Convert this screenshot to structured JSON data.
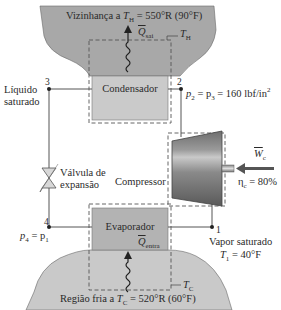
{
  "diagram": {
    "type": "vapor-compression refrigeration cycle",
    "hot_reservoir": {
      "label_prefix": "Vizinhança a ",
      "symbol": "T",
      "subscript": "H",
      "value": " = 550°R (90°F)",
      "heat_label": "Q",
      "heat_sub": "sai",
      "boundary_label": "T",
      "boundary_sub": "H"
    },
    "cold_reservoir": {
      "label_prefix": "Região fria a ",
      "symbol": "T",
      "subscript": "C",
      "value": " = 520°R (60°F)",
      "heat_label": "Q",
      "heat_sub": "entra",
      "boundary_label": "T",
      "boundary_sub": "C"
    },
    "components": {
      "condenser": "Condensador",
      "evaporator": "Evaporador",
      "compressor": "Compressor",
      "valve_line1": "Válvula de",
      "valve_line2": "expansão"
    },
    "states": {
      "s1": "1",
      "s2": "2",
      "s3": "3",
      "s4": "4"
    },
    "annotations": {
      "state3_line1": "Líquido",
      "state3_line2": "saturado",
      "state2_pressure": "p",
      "state2_rest": " = p",
      "state2_value": " = 160 lbf/in",
      "state2_exp": "2",
      "state4_eq": "p",
      "state4_eq_sub1": "4",
      "state4_eq_mid": " = p",
      "state4_eq_sub2": "1",
      "state1_line1": "Vapor saturado",
      "state1_T": "T",
      "state1_sub": "1",
      "state1_value": " = 40°F",
      "work_label": "W",
      "work_sub": "c",
      "eta_label": "η",
      "eta_sub": "c",
      "eta_value": " = 80%"
    },
    "colors": {
      "reservoir_fill": "#a9a9a9",
      "component_fill": "#c8c8c8",
      "evaporator_fill": "#b4b4b4",
      "line": "#444444",
      "dashed": "#555555"
    }
  }
}
